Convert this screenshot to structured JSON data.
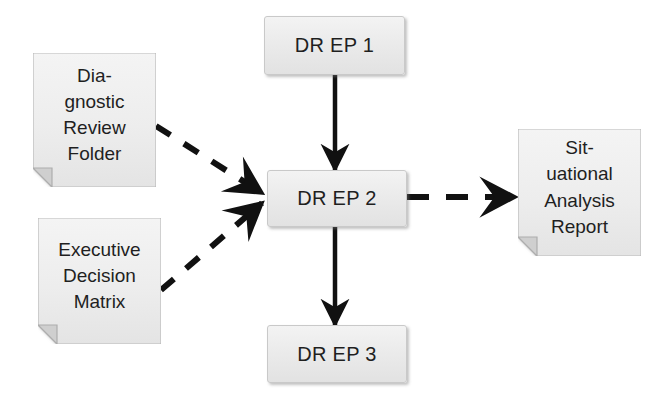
{
  "diagram": {
    "background_color": "#ffffff",
    "box_fill_top": "#f3f3f3",
    "box_fill_bottom": "#e2e2e2",
    "box_border_color": "#c9c9c9",
    "connector_color": "#111111",
    "text_color": "#1f1f1f"
  },
  "process_boxes": [
    {
      "id": "dr-ep-1",
      "label": "DR EP 1",
      "x": 264,
      "y": 16,
      "w": 141,
      "h": 59
    },
    {
      "id": "dr-ep-2",
      "label": "DR EP 2",
      "x": 267,
      "y": 170,
      "w": 140,
      "h": 57
    },
    {
      "id": "dr-ep-3",
      "label": "DR EP 3",
      "x": 267,
      "y": 325,
      "w": 140,
      "h": 58
    }
  ],
  "documents": [
    {
      "id": "diagnostic-review-folder",
      "lines": [
        "Dia-",
        "gnostic",
        "Review",
        "Folder"
      ],
      "x": 33,
      "y": 53,
      "w": 123,
      "h": 134
    },
    {
      "id": "executive-decision-matrix",
      "lines": [
        "Executive",
        "Decision",
        "Matrix"
      ],
      "x": 38,
      "y": 218,
      "w": 123,
      "h": 126
    },
    {
      "id": "situational-analysis-report",
      "lines": [
        "Sit-",
        "uational",
        "Analysis",
        "Report"
      ],
      "x": 518,
      "y": 129,
      "w": 123,
      "h": 127
    }
  ],
  "connectors": [
    {
      "id": "dr-ep-1-to-dr-ep-2",
      "style": "solid",
      "from": "dr-ep-1",
      "to": "dr-ep-2",
      "direction": "down"
    },
    {
      "id": "dr-ep-2-to-dr-ep-3",
      "style": "solid",
      "from": "dr-ep-2",
      "to": "dr-ep-3",
      "direction": "down"
    },
    {
      "id": "diagnostic-review-folder-to-dr-ep-2",
      "style": "dashed",
      "from": "diagnostic-review-folder",
      "to": "dr-ep-2",
      "direction": "down-right"
    },
    {
      "id": "executive-decision-matrix-to-dr-ep-2",
      "style": "dashed",
      "from": "executive-decision-matrix",
      "to": "dr-ep-2",
      "direction": "up-right"
    },
    {
      "id": "dr-ep-2-to-situational-analysis-report",
      "style": "dashed",
      "from": "dr-ep-2",
      "to": "situational-analysis-report",
      "direction": "right"
    }
  ]
}
